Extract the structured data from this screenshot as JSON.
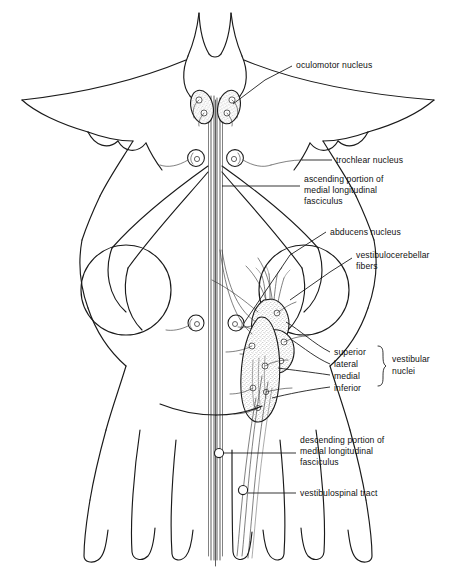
{
  "figure": {
    "background_color": "#ffffff",
    "line_color": "#1a1a1a",
    "shading_color": "#bdbdbd"
  },
  "labels": {
    "oculomotor_nucleus": "oculomotor nucleus",
    "trochlear_nucleus": "trochlear nucleus",
    "ascending_mlf_line1": "ascending portion of",
    "ascending_mlf_line2": "medial longitudinal",
    "ascending_mlf_line3": "fasciculus",
    "abducens_nucleus": "abducens nucleus",
    "vestibulocerebellar_line1": "vestibulocerebellar",
    "vestibulocerebellar_line2": "fibers",
    "vestibular_superior": "superior",
    "vestibular_lateral": "lateral",
    "vestibular_medial": "medial",
    "vestibular_inferior": "inferior",
    "vestibular_group_line1": "vestibular",
    "vestibular_group_line2": "nuclei",
    "descending_mlf_line1": "descending portion of",
    "descending_mlf_line2": "medial longitudinal",
    "descending_mlf_line3": "fasciculus",
    "vestibulospinal_tract": "vestibulospinal tract"
  },
  "structures": {
    "oculomotor_nuclei": {
      "name": "oculomotor nucleus",
      "count": 2,
      "shaded": true
    },
    "trochlear_nuclei": {
      "name": "trochlear nucleus",
      "count": 2,
      "shaded": false
    },
    "abducens_nuclei": {
      "name": "abducens nucleus",
      "count": 2,
      "shaded": false
    },
    "vestibular_nuclear_complex": {
      "name": "vestibular nuclei",
      "subnuclei": [
        "superior",
        "lateral",
        "medial",
        "inferior"
      ],
      "shaded": true
    },
    "mlf": {
      "name": "medial longitudinal fasciculus",
      "portions": [
        "ascending",
        "descending"
      ]
    },
    "vestibulospinal_tract": {
      "name": "vestibulospinal tract"
    },
    "cerebellar_peduncle": {
      "name": "cerebellar peduncle"
    }
  }
}
